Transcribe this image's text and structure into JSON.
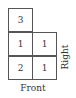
{
  "diagram": {
    "type": "top-view stacking grid",
    "grid": [
      [
        3,
        null
      ],
      [
        1,
        1
      ],
      [
        2,
        1
      ]
    ],
    "cells": [
      {
        "row": 0,
        "col": 0,
        "value": "3"
      },
      {
        "row": 1,
        "col": 0,
        "value": "1"
      },
      {
        "row": 1,
        "col": 1,
        "value": "1"
      },
      {
        "row": 2,
        "col": 0,
        "value": "2"
      },
      {
        "row": 2,
        "col": 1,
        "value": "1"
      }
    ],
    "labels": {
      "front": "Front",
      "right": "Right"
    },
    "colors": {
      "line": "#555555",
      "text": "#333333",
      "background": "#ffffff"
    }
  }
}
